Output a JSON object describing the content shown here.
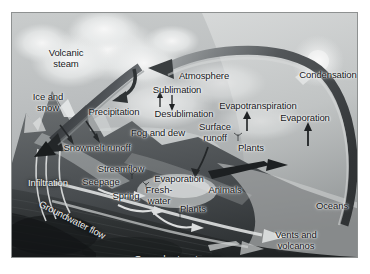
{
  "figure": {
    "kind": "water-cycle-diagram",
    "style": "grayscale landscape illustration",
    "background_color": "#b9bcbc",
    "frame_border_color": "#8e9191",
    "label_color": "#16181a",
    "label_color_inverted": "#f2f4f4",
    "arrow_color_dark": "#2e3133",
    "arrow_color_light": "#e8eaea"
  },
  "labels": [
    {
      "id": "volcanic-steam",
      "text": "Volcanic\nsteam",
      "x": 54,
      "y": 45,
      "tone": "dark"
    },
    {
      "id": "ice-and-snow",
      "text": "Ice and\nsnow",
      "x": 36,
      "y": 89,
      "tone": "dark"
    },
    {
      "id": "precipitation",
      "text": "Precipitation",
      "x": 102,
      "y": 99,
      "tone": "dark"
    },
    {
      "id": "snowmelt-runoff",
      "text": "Snowmelt runoff",
      "x": 85,
      "y": 135,
      "tone": "dark"
    },
    {
      "id": "atmosphere",
      "text": "Atmosphere",
      "x": 192,
      "y": 63,
      "tone": "dark"
    },
    {
      "id": "sublimation",
      "text": "Sublimation",
      "x": 165,
      "y": 77,
      "tone": "dark"
    },
    {
      "id": "desublimation",
      "text": "Desublimation",
      "x": 172,
      "y": 101,
      "tone": "dark"
    },
    {
      "id": "fog-and-dew",
      "text": "Fog and dew",
      "x": 146,
      "y": 120,
      "tone": "dark"
    },
    {
      "id": "evapotranspiration",
      "text": "Evapotranspiration",
      "x": 246,
      "y": 93,
      "tone": "dark"
    },
    {
      "id": "condensation",
      "text": "Condensation",
      "x": 316,
      "y": 62,
      "tone": "dark"
    },
    {
      "id": "evaporation-ocean",
      "text": "Evaporation",
      "x": 293,
      "y": 105,
      "tone": "dark"
    },
    {
      "id": "surface-runoff",
      "text": "Surface\nrunoff",
      "x": 203,
      "y": 119,
      "tone": "dark"
    },
    {
      "id": "plants-upper",
      "text": "Plants",
      "x": 239,
      "y": 135,
      "tone": "dark"
    },
    {
      "id": "streamflow",
      "text": "Streamflow",
      "x": 109,
      "y": 156,
      "tone": "dark"
    },
    {
      "id": "infiltration",
      "text": "Infiltration",
      "x": 36,
      "y": 170,
      "tone": "light"
    },
    {
      "id": "seepage",
      "text": "Seepage",
      "x": 89,
      "y": 169,
      "tone": "dark"
    },
    {
      "id": "spring",
      "text": "Spring",
      "x": 114,
      "y": 183,
      "tone": "dark"
    },
    {
      "id": "evaporation-lake",
      "text": "Evaporation",
      "x": 167,
      "y": 166,
      "tone": "dark"
    },
    {
      "id": "fresh-water",
      "text": "Fresh-\nwater",
      "x": 147,
      "y": 182,
      "tone": "dark"
    },
    {
      "id": "plants-lower",
      "text": "Plants",
      "x": 181,
      "y": 196,
      "tone": "dark"
    },
    {
      "id": "animals",
      "text": "Animals",
      "x": 213,
      "y": 177,
      "tone": "dark"
    },
    {
      "id": "oceans",
      "text": "Oceans",
      "x": 320,
      "y": 193,
      "tone": "dark"
    },
    {
      "id": "vents-and-volcanos",
      "text": "Vents and\nvolcanos",
      "x": 284,
      "y": 227,
      "tone": "dark"
    },
    {
      "id": "groundwater-storage",
      "text": "Groundwater storage",
      "x": 166,
      "y": 246,
      "tone": "light"
    },
    {
      "id": "groundwater-flow",
      "text": "Groundwater flow",
      "x": 54,
      "y": 196,
      "tone": "light",
      "rotate": 27
    }
  ],
  "flow_arrows": [
    {
      "id": "arrow-evaporation-to-atmosphere",
      "from": "Oceans",
      "to": "Atmosphere",
      "shape": "large-arc-counterclockwise",
      "tone": "dark"
    },
    {
      "id": "arrow-precipitation",
      "from": "Atmosphere",
      "to": "Ice and snow",
      "shape": "descending-band",
      "tone": "dark"
    },
    {
      "id": "arrow-condensation",
      "from": "Evaporation",
      "to": "Condensation",
      "shape": "arc-head",
      "tone": "light"
    },
    {
      "id": "arrow-sublimation",
      "from": "Ice and snow",
      "to": "Atmosphere",
      "shape": "short-up",
      "tone": "dark"
    },
    {
      "id": "arrow-desublimation",
      "from": "Atmosphere",
      "to": "Surface",
      "shape": "short-down",
      "tone": "dark"
    },
    {
      "id": "arrow-evaporation-ocean-up",
      "from": "Oceans",
      "to": "Atmosphere",
      "shape": "short-up",
      "tone": "dark"
    },
    {
      "id": "arrow-evapotranspiration-up",
      "from": "Plants",
      "to": "Atmosphere",
      "shape": "short-up",
      "tone": "dark"
    },
    {
      "id": "arrow-snowmelt-runoff",
      "from": "Ice and snow",
      "to": "Streamflow",
      "shape": "short-diagonal",
      "tone": "dark"
    },
    {
      "id": "arrow-surface-runoff",
      "from": "Surface runoff",
      "to": "Animals",
      "shape": "curved-short",
      "tone": "dark"
    },
    {
      "id": "arrow-streamflow-to-ocean",
      "from": "Streamflow",
      "to": "Oceans",
      "shape": "long-taper",
      "tone": "dark"
    },
    {
      "id": "arrow-infiltration",
      "from": "Surface",
      "to": "Groundwater",
      "shape": "down-curve",
      "tone": "light"
    },
    {
      "id": "arrow-groundwater-flow",
      "from": "Infiltration",
      "to": "Oceans",
      "shape": "long-arc",
      "tone": "light"
    },
    {
      "id": "arrow-groundwater-storage",
      "from": "Groundwater",
      "to": "Oceans",
      "shape": "long-arc-lower",
      "tone": "light"
    },
    {
      "id": "arrow-seepage",
      "from": "Groundwater",
      "to": "Freshwater",
      "shape": "short-curve",
      "tone": "light"
    },
    {
      "id": "arrow-spring",
      "from": "Groundwater",
      "to": "Streamflow",
      "shape": "short-curve",
      "tone": "light"
    }
  ]
}
